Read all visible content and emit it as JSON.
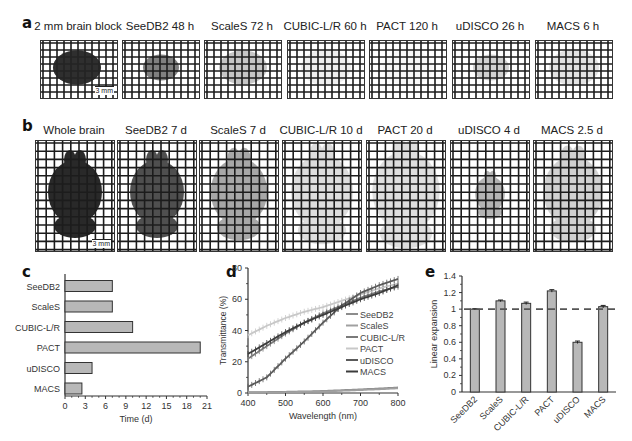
{
  "figure": {
    "panel_a": {
      "label": "a",
      "tiles": [
        {
          "title": "2 mm brain block",
          "shade": "#2a2a2a",
          "opacity": 0.95,
          "shape": "block",
          "scalebar": "3 mm"
        },
        {
          "title": "SeeDB2 48 h",
          "shade": "#6a6a6a",
          "opacity": 0.85,
          "shape": "block-small"
        },
        {
          "title": "ScaleS 72 h",
          "shade": "#a8a8a8",
          "opacity": 0.65,
          "shape": "block-wide"
        },
        {
          "title": "CUBIC-L/R 60 h",
          "shade": "#d0d0d0",
          "opacity": 0.35,
          "shape": "block-faint"
        },
        {
          "title": "PACT 120 h",
          "shade": "#dcdcdc",
          "opacity": 0.2,
          "shape": "block-faint"
        },
        {
          "title": "uDISCO 26 h",
          "shade": "#7a7a7a",
          "opacity": 0.35,
          "shape": "block-small"
        },
        {
          "title": "MACS 6 h",
          "shade": "#b8b8b8",
          "opacity": 0.4,
          "shape": "block-faint"
        }
      ]
    },
    "panel_b": {
      "label": "b",
      "tiles": [
        {
          "title": "Whole brain",
          "shade": "#1e1e1e",
          "opacity": 0.95,
          "scale": 1.0,
          "scalebar": "3 mm"
        },
        {
          "title": "SeeDB2 7 d",
          "shade": "#3c3c3c",
          "opacity": 0.9,
          "scale": 1.0
        },
        {
          "title": "ScaleS 7 d",
          "shade": "#8a8a8a",
          "opacity": 0.75,
          "scale": 1.05
        },
        {
          "title": "CUBIC-L/R 10 d",
          "shade": "#b4b4b4",
          "opacity": 0.45,
          "scale": 1.15
        },
        {
          "title": "PACT 20 d",
          "shade": "#b8b8b8",
          "opacity": 0.45,
          "scale": 1.25
        },
        {
          "title": "uDISCO 4 d",
          "shade": "#6a6a6a",
          "opacity": 0.5,
          "scale": 0.55
        },
        {
          "title": "MACS 2.5 d",
          "shade": "#9a9a9a",
          "opacity": 0.45,
          "scale": 1.1
        }
      ]
    }
  },
  "chart_data": [
    {
      "panel": "c",
      "type": "bar",
      "orientation": "horizontal",
      "title": "",
      "categories": [
        "SeeDB2",
        "ScaleS",
        "CUBIC-L/R",
        "PACT",
        "uDISCO",
        "MACS"
      ],
      "values": [
        7,
        7,
        10,
        20,
        4,
        2.5
      ],
      "xlabel": "Time (d)",
      "ylabel": "",
      "xlim": [
        0,
        21
      ],
      "xticks": [
        0,
        3,
        6,
        9,
        12,
        15,
        18,
        21
      ],
      "grid": false,
      "bar_color": "#b8b8b8"
    },
    {
      "panel": "d",
      "type": "line",
      "title": "",
      "xlabel": "Wavelength (nm)",
      "ylabel": "Transmittance (%)",
      "xlim": [
        400,
        800
      ],
      "ylim": [
        0,
        80
      ],
      "xticks": [
        400,
        500,
        600,
        700,
        800
      ],
      "yticks": [
        0,
        20,
        40,
        60,
        80
      ],
      "grid": false,
      "legend_position": "right-middle",
      "x": [
        400,
        450,
        500,
        550,
        600,
        650,
        700,
        750,
        800
      ],
      "series": [
        {
          "name": "SeeDB2",
          "color": "#8c8c8c",
          "values": [
            0.5,
            0.6,
            0.8,
            1.0,
            1.3,
            1.8,
            2.3,
            2.9,
            3.5
          ]
        },
        {
          "name": "ScaleS",
          "color": "#a0a0a0",
          "values": [
            0.3,
            0.4,
            0.5,
            0.7,
            1.0,
            1.4,
            1.9,
            2.4,
            3.0
          ]
        },
        {
          "name": "CUBIC-L/R",
          "color": "#7a7a7a",
          "values": [
            22,
            30,
            38,
            45,
            51,
            56,
            61,
            65,
            68
          ]
        },
        {
          "name": "PACT",
          "color": "#c8c8c8",
          "values": [
            37,
            43,
            48,
            52,
            55,
            59,
            63,
            67,
            70
          ]
        },
        {
          "name": "uDISCO",
          "color": "#5a5a5a",
          "values": [
            4,
            10,
            22,
            33,
            45,
            56,
            64,
            69,
            73
          ]
        },
        {
          "name": "MACS",
          "color": "#3c3c3c",
          "values": [
            25,
            32,
            39,
            45,
            50,
            55,
            60,
            64,
            69
          ]
        }
      ]
    },
    {
      "panel": "e",
      "type": "bar",
      "title": "",
      "categories": [
        "SeeDB2",
        "ScaleS",
        "CUBIC-L/R",
        "PACT",
        "uDISCO",
        "MACS"
      ],
      "values": [
        1.0,
        1.1,
        1.07,
        1.22,
        0.6,
        1.03
      ],
      "errors": [
        0.005,
        0.01,
        0.015,
        0.015,
        0.015,
        0.015
      ],
      "xlabel": "",
      "ylabel": "Linear expansion",
      "ylim": [
        0,
        1.4
      ],
      "yticks": [
        0,
        0.2,
        0.4,
        0.6,
        0.8,
        1,
        1.2,
        1.4
      ],
      "reference_line": 1.0,
      "grid": false,
      "bar_color": "#b8b8b8"
    }
  ],
  "labels": {
    "c": "c",
    "d": "d",
    "e": "e"
  }
}
